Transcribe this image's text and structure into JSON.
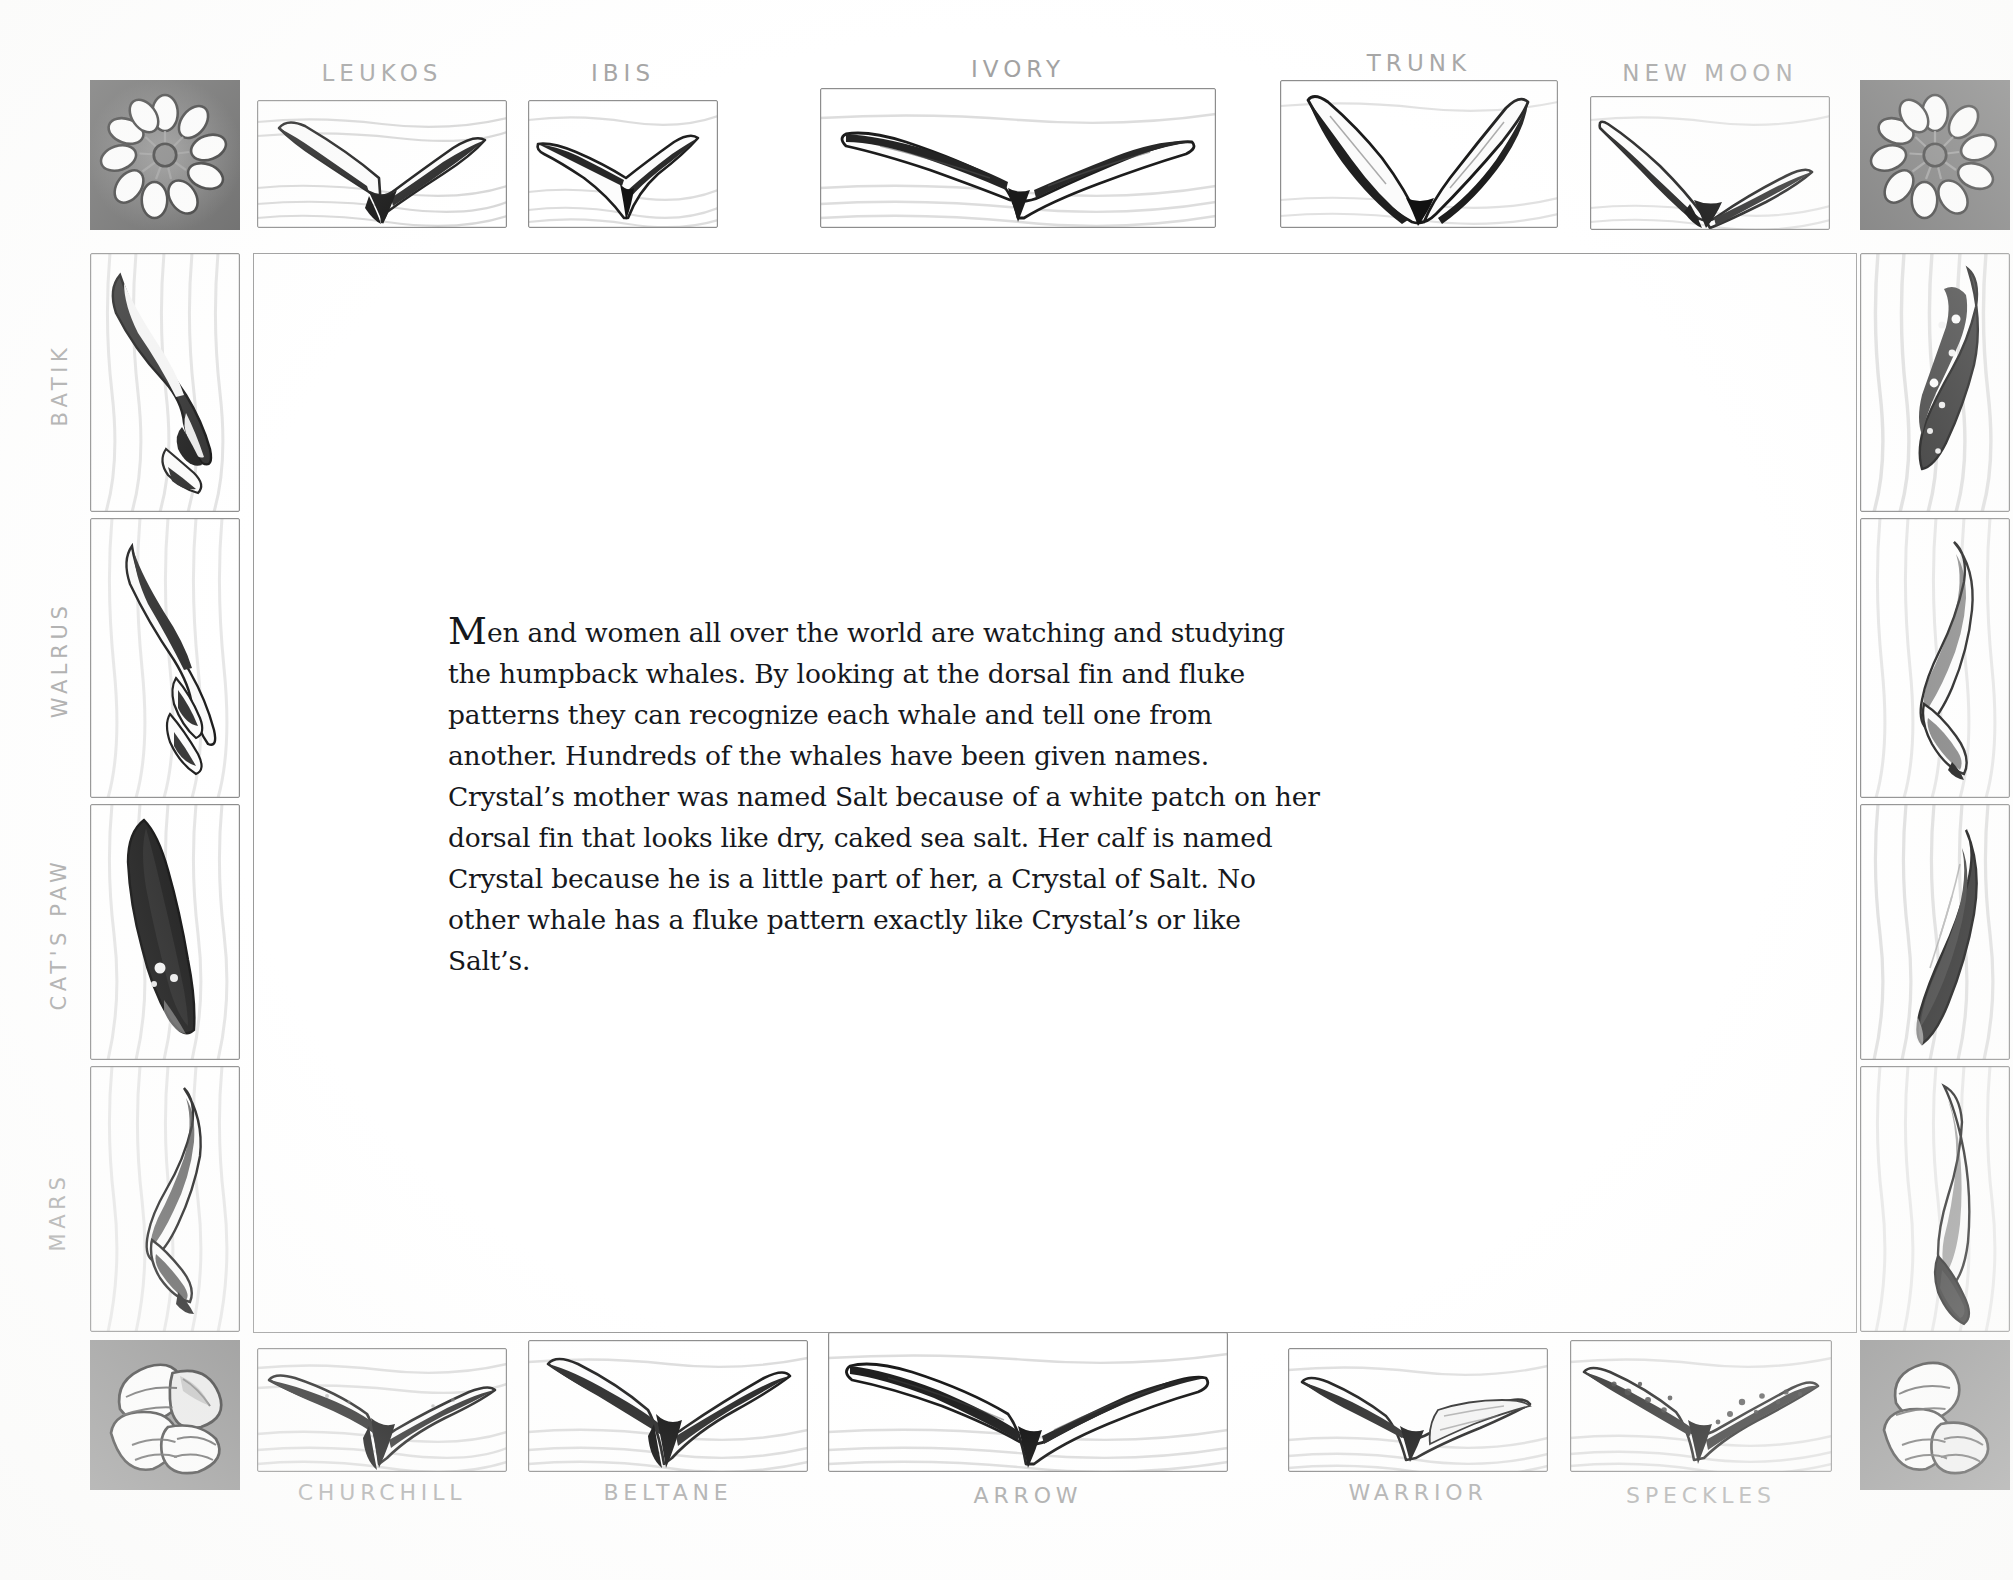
{
  "page": {
    "background_color": "#ffffff",
    "ink_color": "#16181c",
    "pencil_color": "#9b9b9b"
  },
  "body_text": {
    "dropcap": "M",
    "paragraph": "en and women all over the world are watching and studying the humpback whales. By looking at the dorsal fin and fluke patterns they can recognize each whale and tell one from another. Hundreds of the whales have been given names. Crystal’s mother was named Salt because of a white patch on her dorsal fin that looks like dry, caked sea salt. Her calf is named Crystal because he is a little part of her, a Crystal of Salt. No other whale has a fluke pattern exactly like Crystal’s or like Salt’s."
  },
  "border": {
    "top_labels": [
      "LEUKOS",
      "IBIS",
      "IVORY",
      "TRUNK",
      "NEW MOON"
    ],
    "bottom_labels": [
      "CHURCHILL",
      "BELTANE",
      "ARROW",
      "WARRIOR",
      "SPECKLES"
    ],
    "left_labels": [
      "BATIK",
      "WALRUS",
      "CAT'S PAW",
      "MARS"
    ],
    "right_labels": [
      "",
      "",
      "",
      ""
    ],
    "corner_icons": [
      "barnacle-rosette-icon",
      "barnacle-rosette-icon",
      "barnacle-cluster-icon",
      "barnacle-cluster-icon"
    ],
    "tile_icon": "whale-fluke-icon"
  },
  "tiles": {
    "top": [
      {
        "name": "LEUKOS",
        "icon": "whale-fluke-icon",
        "variant": "wide-notched"
      },
      {
        "name": "IBIS",
        "icon": "whale-fluke-icon",
        "variant": "tilted-left"
      },
      {
        "name": "IVORY",
        "icon": "whale-fluke-icon",
        "variant": "broad-white"
      },
      {
        "name": "TRUNK",
        "icon": "whale-fluke-icon",
        "variant": "narrow-dark"
      },
      {
        "name": "NEW MOON",
        "icon": "whale-fluke-icon",
        "variant": "crescent"
      }
    ],
    "bottom": [
      {
        "name": "CHURCHILL",
        "icon": "whale-fluke-icon",
        "variant": "dark-center"
      },
      {
        "name": "BELTANE",
        "icon": "whale-fluke-icon",
        "variant": "dark-center"
      },
      {
        "name": "ARROW",
        "icon": "whale-fluke-icon",
        "variant": "broad-white"
      },
      {
        "name": "WARRIOR",
        "icon": "whale-fluke-icon",
        "variant": "pale-right"
      },
      {
        "name": "SPECKLES",
        "icon": "whale-fluke-icon",
        "variant": "speckled"
      }
    ],
    "left": [
      {
        "name": "BATIK",
        "icon": "whale-fluke-icon",
        "variant": "vertical-dark"
      },
      {
        "name": "WALRUS",
        "icon": "whale-fluke-icon",
        "variant": "vertical-pale"
      },
      {
        "name": "CAT'S PAW",
        "icon": "whale-fluke-icon",
        "variant": "vertical-black"
      },
      {
        "name": "MARS",
        "icon": "whale-fluke-icon",
        "variant": "vertical-split"
      }
    ],
    "right": [
      {
        "name": "",
        "icon": "whale-fluke-icon",
        "variant": "vertical-speckled"
      },
      {
        "name": "",
        "icon": "whale-fluke-icon",
        "variant": "vertical-pale"
      },
      {
        "name": "",
        "icon": "whale-fluke-icon",
        "variant": "vertical-dark"
      },
      {
        "name": "",
        "icon": "whale-fluke-icon",
        "variant": "vertical-curl"
      }
    ]
  }
}
